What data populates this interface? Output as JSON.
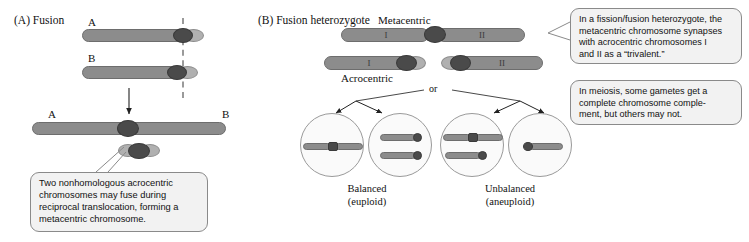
{
  "figure": {
    "panel_a": {
      "label": "(A) Fusion",
      "chromosome_top_label": "A",
      "chromosome_bottom_label": "B",
      "product_left_label": "A",
      "product_right_label": "B",
      "callout": {
        "line1": "Two nonhomologous acrocentric",
        "line2": "chromosomes may fuse during",
        "line3": "reciprocal translocation, forming a",
        "line4": "metacentric chromosome."
      }
    },
    "panel_b": {
      "label": "(B) Fusion heterozygote",
      "metacentric_label": "Metacentric",
      "acrocentric_label": "Acrocentric",
      "arm_i": "I",
      "arm_ii": "II",
      "or_label": "or",
      "outcomes": [
        {
          "name": "Balanced",
          "ploidy": "(euploid)"
        },
        {
          "name": "Unbalanced",
          "ploidy": "(aneuploid)"
        }
      ],
      "callout_trivalent": {
        "line1": "In a fission/fusion heterozygote, the",
        "line2": "metacentric chromosome synapses",
        "line3": "with acrocentric chromosomes I",
        "line4": "and II as a “trivalent.”"
      },
      "callout_meiosis": {
        "line1": "In meiosis, some gametes get a",
        "line2": "complete chromosome comple-",
        "line3": "ment, but others may not."
      }
    },
    "colors": {
      "arm": "#8c8c8c",
      "centromere": "#4a4a4a",
      "stub": "#b0b0b0",
      "callout_bg": "#f2f2f2",
      "callout_border": "#8a8a8a",
      "dashed_guide": "#9a9a9a"
    }
  }
}
